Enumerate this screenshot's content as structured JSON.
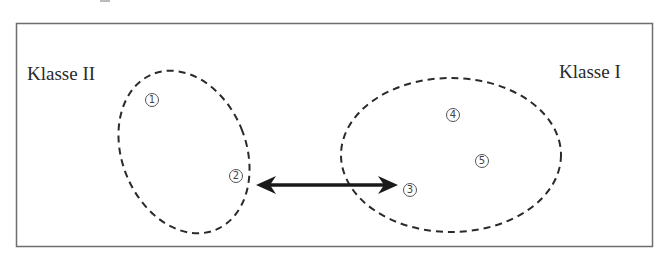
{
  "diagram": {
    "labels": {
      "class_two": "Klasse II",
      "class_one": "Klasse I"
    },
    "clusters": [
      {
        "name": "Klasse II",
        "shape": "dashed-ellipse",
        "members": [
          "1",
          "2"
        ]
      },
      {
        "name": "Klasse I",
        "shape": "dashed-ellipse",
        "members": [
          "3",
          "4",
          "5"
        ]
      }
    ],
    "points": [
      {
        "id": "1",
        "label": "1"
      },
      {
        "id": "2",
        "label": "2"
      },
      {
        "id": "3",
        "label": "3"
      },
      {
        "id": "4",
        "label": "4"
      },
      {
        "id": "5",
        "label": "5"
      }
    ],
    "edges": [
      {
        "from": "2",
        "to": "3",
        "style": "double-headed-arrow"
      }
    ],
    "colors": {
      "stroke": "#2a2a2a",
      "frame": "#6e6e6e",
      "background": "#ffffff"
    }
  }
}
